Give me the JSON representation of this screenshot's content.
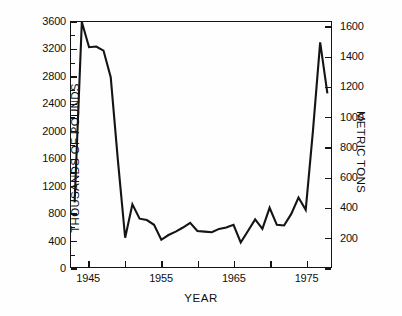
{
  "chart_data": {
    "type": "line",
    "title": "",
    "xlabel": "YEAR",
    "ylabel": "THOUSANDS OF POUNDS",
    "ylabel_right": "METRIC TONS",
    "xlim": [
      1942.5,
      1978.5
    ],
    "ylim": [
      0,
      3600
    ],
    "ylim_right": [
      0,
      1632.9
    ],
    "grid": false,
    "legend": null,
    "yticks": [
      0,
      400,
      800,
      1200,
      1600,
      2000,
      2400,
      2800,
      3200,
      3600
    ],
    "ytick_labels": [
      "0",
      "400",
      "800",
      "1200",
      "1600",
      "2000",
      "2400",
      "2800",
      "3200",
      "3600"
    ],
    "yticks_right": [
      0,
      200,
      400,
      600,
      800,
      1000,
      1200,
      1400,
      1600
    ],
    "ytick_labels_right": [
      "0",
      "200",
      "400",
      "600",
      "800",
      "1000",
      "1200",
      "1400",
      "1600"
    ],
    "xticks": [
      1945,
      1950,
      1955,
      1960,
      1965,
      1970,
      1975
    ],
    "xtick_labels": [
      "1945",
      "",
      "1955",
      "",
      "1965",
      "",
      "1975"
    ],
    "xtick_labels_shown": [
      "1945",
      "1955",
      "1965",
      "1975"
    ],
    "x": [
      1943,
      1944,
      1945,
      1946,
      1947,
      1948,
      1949,
      1950,
      1951,
      1952,
      1953,
      1954,
      1955,
      1956,
      1957,
      1958,
      1959,
      1960,
      1961,
      1962,
      1963,
      1964,
      1965,
      1966,
      1967,
      1968,
      1969,
      1970,
      1971,
      1972,
      1973,
      1974,
      1975,
      1976,
      1977,
      1978
    ],
    "values": [
      950,
      3600,
      3230,
      3240,
      3180,
      2790,
      1560,
      430,
      920,
      710,
      690,
      620,
      400,
      470,
      520,
      580,
      650,
      530,
      520,
      510,
      560,
      580,
      620,
      360,
      530,
      700,
      560,
      870,
      620,
      610,
      780,
      1020,
      840,
      2000,
      3300,
      2550
    ],
    "units": "thousands of pounds",
    "conversion_factor": 2.2046
  },
  "axes": {
    "left_title": "THOUSANDS OF POUNDS",
    "right_title": "METRIC TONS",
    "bottom_title": "YEAR"
  },
  "colors": {
    "line": "#141414",
    "axis": "#141414",
    "background": "#ffffff",
    "text": "#101010"
  }
}
